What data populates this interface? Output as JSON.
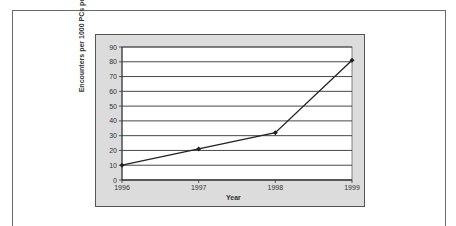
{
  "chart_data": {
    "type": "line",
    "title": "",
    "xlabel": "Year",
    "ylabel": "Encounters per 1000 PCs per month",
    "categories": [
      "1996",
      "1997",
      "1998",
      "1999"
    ],
    "series": [
      {
        "name": "Encounters",
        "values": [
          10,
          21,
          32,
          81
        ]
      }
    ],
    "ylim": [
      0,
      90
    ],
    "yticks": [
      0,
      10,
      20,
      30,
      40,
      50,
      60,
      70,
      80,
      90
    ],
    "grid": true,
    "legend": "none",
    "colors": {
      "plot_bg": "#ffffff",
      "chart_bg": "#dcdcdc",
      "line": "#222222"
    }
  }
}
